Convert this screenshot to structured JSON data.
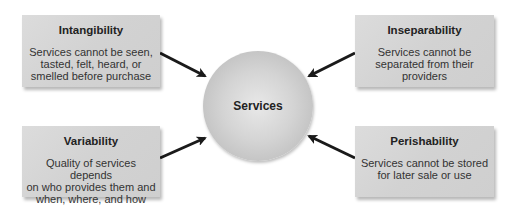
{
  "center": {
    "label": "Services"
  },
  "boxes": [
    {
      "id": "intangibility",
      "title": "Intangibility",
      "description": "Services cannot be seen,\ntasted, felt, heard, or\nsmelled before purchase"
    },
    {
      "id": "inseparability",
      "title": "Inseparability",
      "description": "Services cannot be\nseparated from their\nproviders"
    },
    {
      "id": "variability",
      "title": "Variability",
      "description": "Quality of services depends\non who provides them and\nwhen, where, and how"
    },
    {
      "id": "perishability",
      "title": "Perishability",
      "description": "Services cannot be stored\nfor later sale or use"
    }
  ],
  "colors": {
    "box_fill": "#d4d4d4",
    "circle_fill": "#cccccc",
    "arrow": "#1a1a1a"
  }
}
